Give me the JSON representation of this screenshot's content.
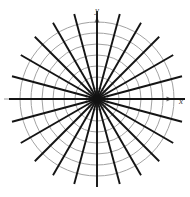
{
  "figure": {
    "name": "polar-coordinate-grid",
    "background_color": "#ffffff",
    "width": 190,
    "height": 197
  },
  "axes": {
    "x_label": "x",
    "y_label": "y",
    "axis_color": "#9a9a9a",
    "arrow_color": "#6f6f6f",
    "label_color": "#3a3a3a",
    "x_axis": {
      "x_start": 4,
      "x_end": 172,
      "y": 99,
      "arrow_tip_x": 172,
      "label_x": 181,
      "label_y": 102
    },
    "y_axis": {
      "y_start": 186,
      "y_end": 17,
      "x": 97,
      "arrow_tip_y": 17,
      "label_x": 97,
      "label_y": 11
    }
  },
  "origin": {
    "cx": 97,
    "cy": 99,
    "dot_radius": 4.2,
    "dot_color": "#111111"
  },
  "grid_circles": {
    "color": "#a2a2a2",
    "stroke_width": 1.0,
    "count": 7,
    "radii": [
      11,
      22,
      33,
      44,
      55,
      66,
      77
    ]
  },
  "radial_lines": {
    "color": "#141414",
    "stroke_width": 1.9,
    "count": 24,
    "angle_step_degrees": 15,
    "inner_radius": 0,
    "outer_radius": 88,
    "angles_degrees": [
      0,
      15,
      30,
      45,
      60,
      75,
      90,
      105,
      120,
      135,
      150,
      165,
      180,
      195,
      210,
      225,
      240,
      255,
      270,
      285,
      300,
      315,
      330,
      345
    ]
  },
  "chart_data": {
    "type": "scatter",
    "title": "",
    "xlabel": "x",
    "ylabel": "y",
    "grid": true,
    "legend": "none",
    "circle_radii": [
      11,
      22,
      33,
      44,
      55,
      66,
      77
    ],
    "spoke_angles_degrees": [
      0,
      15,
      30,
      45,
      60,
      75,
      90,
      105,
      120,
      135,
      150,
      165,
      180,
      195,
      210,
      225,
      240,
      255,
      270,
      285,
      300,
      315,
      330,
      345
    ],
    "spoke_length": 88,
    "xlim": [
      -88,
      88
    ],
    "ylim": [
      -88,
      88
    ]
  }
}
